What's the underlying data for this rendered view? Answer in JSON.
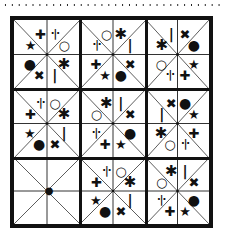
{
  "puzzle": {
    "type": "symbol-sudoku-3x3",
    "symbols": [
      "plus",
      "divide",
      "circle",
      "asterisk",
      "bar",
      "cross",
      "dot",
      "star"
    ],
    "blocks": [
      {
        "row": 0,
        "col": 0,
        "cells": {
          "ul": "star",
          "ut": "plus",
          "rt": "divide",
          "ur": "circle",
          "dl": "dot",
          "db": "cross",
          "bl": "bar",
          "dr": "asterisk"
        }
      },
      {
        "row": 0,
        "col": 1,
        "cells": {
          "ul": "divide",
          "ut": "circle",
          "rt": "asterisk",
          "ur": "bar",
          "dl": "plus",
          "db": "star",
          "bl": "dot",
          "dr": "cross"
        }
      },
      {
        "row": 0,
        "col": 2,
        "cells": {
          "ul": "asterisk",
          "ut": "bar",
          "rt": "cross",
          "ur": "dot",
          "dl": "circle",
          "db": "divide",
          "bl": "plus",
          "dr": "star"
        }
      },
      {
        "row": 1,
        "col": 0,
        "cells": {
          "ul": "plus",
          "ut": "divide",
          "rt": "circle",
          "ur": "asterisk",
          "dl": "star",
          "db": "dot",
          "bl": "cross",
          "dr": "bar"
        }
      },
      {
        "row": 1,
        "col": 1,
        "cells": {
          "ul": "circle",
          "ut": "asterisk",
          "rt": "bar",
          "ur": "cross",
          "dl": "divide",
          "db": "plus",
          "bl": "star",
          "dr": "dot"
        }
      },
      {
        "row": 1,
        "col": 2,
        "cells": {
          "ul": "bar",
          "ut": "cross",
          "rt": "dot",
          "ur": "star",
          "dl": "asterisk",
          "db": "circle",
          "bl": "divide",
          "dr": "plus"
        }
      },
      {
        "row": 2,
        "col": 0,
        "cells": {
          "ul": "",
          "ut": "",
          "rt": "",
          "ur": "",
          "dl": "",
          "db": "",
          "bl": "",
          "dr": "",
          "center": "cursor"
        }
      },
      {
        "row": 2,
        "col": 1,
        "cells": {
          "ul": "plus",
          "ut": "divide",
          "rt": "circle",
          "ur": "asterisk",
          "dl": "star",
          "db": "dot",
          "bl": "cross",
          "dr": "bar"
        }
      },
      {
        "row": 2,
        "col": 2,
        "cells": {
          "ul": "circle",
          "ut": "asterisk",
          "rt": "bar",
          "ur": "cross",
          "dl": "divide",
          "db": "plus",
          "bl": "star",
          "dr": "dot"
        }
      }
    ],
    "glyphs": {
      "plus": "✚",
      "divide": "·|·",
      "circle": "○",
      "asterisk": "✱",
      "bar": "|",
      "cross": "✖",
      "dot": "●",
      "star": "★",
      "cursor": "●"
    }
  }
}
